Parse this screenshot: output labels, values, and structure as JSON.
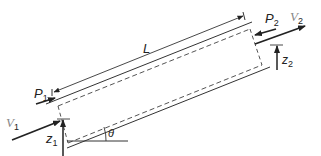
{
  "diagram": {
    "labels": {
      "length": "L",
      "pressure_in": "P",
      "pressure_in_sub": "1",
      "pressure_out": "P",
      "pressure_out_sub": "2",
      "velocity_in": "V",
      "velocity_in_sub": "1",
      "velocity_out": "V",
      "velocity_out_sub": "2",
      "elevation_in": "z",
      "elevation_in_sub": "1",
      "elevation_out": "z",
      "elevation_out_sub": "2",
      "angle": "θ"
    },
    "colors": {
      "line": "#333333",
      "velocity_label": "#888888",
      "background": "#ffffff"
    }
  }
}
